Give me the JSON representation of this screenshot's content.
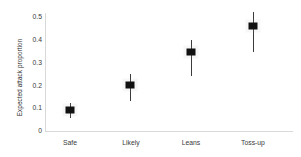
{
  "chart_data": {
    "type": "scatter",
    "title": "",
    "xlabel": "",
    "ylabel": "Expected attack proportion",
    "categories": [
      "Safe",
      "Likely",
      "Leans",
      "Toss-up"
    ],
    "values": [
      0.09,
      0.2,
      0.345,
      0.46
    ],
    "error_low": [
      0.055,
      0.13,
      0.24,
      0.345
    ],
    "error_high": [
      0.125,
      0.25,
      0.4,
      0.52
    ],
    "ylim": [
      0,
      0.5
    ],
    "yticks": [
      "0",
      "0.1",
      "0.2",
      "0.3",
      "0.4",
      "0.5"
    ],
    "ytick_values": [
      0,
      0.1,
      0.2,
      0.3,
      0.4,
      0.5
    ],
    "grid": false,
    "legend": "none",
    "marker_color": "#111111",
    "errorbar_color": "#3b3b3b",
    "axis_color": "#d9d9d9",
    "background": "#ffffff",
    "points": [
      {
        "category": "Safe",
        "value": 0.09,
        "low": 0.055,
        "high": 0.125
      },
      {
        "category": "Likely",
        "value": 0.2,
        "low": 0.13,
        "high": 0.25
      },
      {
        "category": "Leans",
        "value": 0.345,
        "low": 0.24,
        "high": 0.4
      },
      {
        "category": "Toss-up",
        "value": 0.46,
        "low": 0.345,
        "high": 0.52
      }
    ]
  }
}
